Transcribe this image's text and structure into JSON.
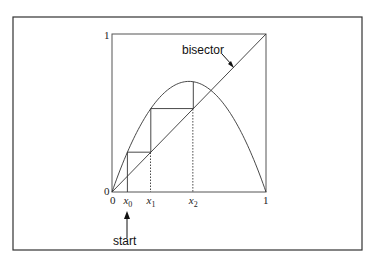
{
  "figure": {
    "type": "cobweb-diagram",
    "map": {
      "kind": "logistic",
      "r": 2.8
    },
    "axis": {
      "x_min_label": "0",
      "x_max_label": "1",
      "y_min_label": "0",
      "y_max_label": "1",
      "range": [
        0,
        1
      ]
    },
    "iterates": [
      {
        "label": "x",
        "sub": "0",
        "value": 0.1
      },
      {
        "label": "x",
        "sub": "1",
        "value": 0.25
      },
      {
        "label": "x",
        "sub": "2",
        "value": 0.525
      }
    ],
    "bisector_label": "bisector",
    "start_label": "start"
  },
  "chart_data": {
    "type": "line",
    "title": "",
    "xlabel": "",
    "ylabel": "",
    "xlim": [
      0,
      1
    ],
    "ylim": [
      0,
      1
    ],
    "series": [
      {
        "name": "f(x) = 2.8 x (1 - x)",
        "function": "2.8*x*(1-x)"
      },
      {
        "name": "bisector",
        "function": "x"
      }
    ],
    "cobweb_points": [
      [
        0.1,
        0
      ],
      [
        0.1,
        0.252
      ],
      [
        0.252,
        0.252
      ],
      [
        0.252,
        0.528
      ],
      [
        0.528,
        0.528
      ],
      [
        0.528,
        0.698
      ]
    ],
    "tick_labels": {
      "x": [
        "0",
        "1"
      ],
      "y": [
        "0",
        "1"
      ]
    },
    "annotations": [
      "bisector",
      "start",
      "x0",
      "x1",
      "x2"
    ]
  }
}
